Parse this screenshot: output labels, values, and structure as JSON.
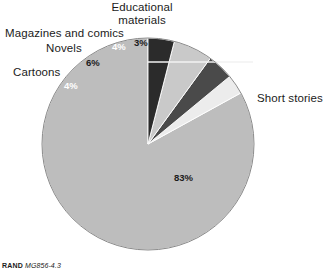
{
  "figure": {
    "footer_rand": "RAND",
    "footer_number": "MG856-4.3"
  },
  "labels": {
    "educational": "Educational materials",
    "magazines": "Magazines and comics",
    "novels": "Novels",
    "cartoons": "Cartoons",
    "short_stories": "Short stories"
  },
  "percent_labels": {
    "educational": "3%",
    "magazines": "4%",
    "novels": "6%",
    "cartoons": "4%",
    "short_stories": "83%"
  },
  "colors": {
    "short_stories": "#bdbdbd",
    "cartoons": "#2b2b2b",
    "novels": "#c9c9c9",
    "magazines": "#4a4a4a",
    "educational": "#ececec",
    "outline": "#8a8a8a",
    "leader_line": "#f2f2f2",
    "text": "#1b1b1b",
    "background": "#ffffff"
  },
  "chart_data": {
    "type": "pie",
    "title": "",
    "xlabel": "",
    "ylabel": "",
    "legend_position": "outside-labels",
    "grid": false,
    "start_angle_deg": 0,
    "direction": "counterclockwise",
    "categories": [
      "Short stories",
      "Educational materials",
      "Magazines and comics",
      "Novels",
      "Cartoons"
    ],
    "values": [
      83,
      3,
      4,
      6,
      4
    ],
    "value_unit": "%",
    "slices": [
      {
        "label": "Short stories",
        "value": 83,
        "display": "83%",
        "color": "#bdbdbd",
        "text_color": "#1b1b1b"
      },
      {
        "label": "Educational materials",
        "value": 3,
        "display": "3%",
        "color": "#ececec",
        "text_color": "#1b1b1b"
      },
      {
        "label": "Magazines and comics",
        "value": 4,
        "display": "4%",
        "color": "#4a4a4a",
        "text_color": "#ffffff"
      },
      {
        "label": "Novels",
        "value": 6,
        "display": "6%",
        "color": "#c9c9c9",
        "text_color": "#1b1b1b"
      },
      {
        "label": "Cartoons",
        "value": 4,
        "display": "4%",
        "color": "#2b2b2b",
        "text_color": "#ffffff"
      }
    ],
    "geometry": {
      "cx": 148,
      "cy": 144,
      "r": 106
    }
  }
}
